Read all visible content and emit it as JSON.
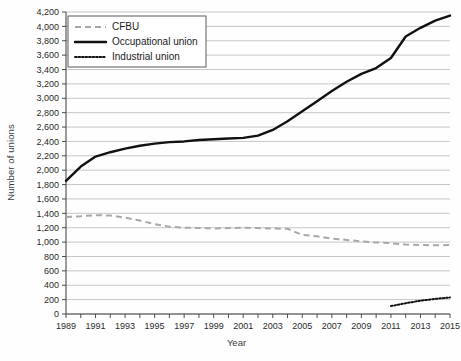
{
  "chart_data": {
    "type": "line",
    "title": "",
    "xlabel": "Year",
    "ylabel": "Number of unions",
    "xlim": [
      1989,
      2015
    ],
    "ylim": [
      0,
      4200
    ],
    "ytick_step": 200,
    "xtick_step": 1,
    "xtick_label_step": 2,
    "grid": true,
    "legend_position": "top-left",
    "x": [
      1989,
      1990,
      1991,
      1992,
      1993,
      1994,
      1995,
      1996,
      1997,
      1998,
      1999,
      2000,
      2001,
      2002,
      2003,
      2004,
      2005,
      2006,
      2007,
      2008,
      2009,
      2010,
      2011,
      2012,
      2013,
      2014,
      2015
    ],
    "xtick_labels": [
      "1989",
      "1991",
      "1993",
      "1995",
      "1997",
      "1999",
      "2001",
      "2003",
      "2005",
      "2007",
      "2009",
      "2011",
      "2013",
      "2015"
    ],
    "ytick_labels": [
      "0",
      "200",
      "400",
      "600",
      "800",
      "1,000",
      "1,200",
      "1,400",
      "1,600",
      "1,800",
      "2,000",
      "2,200",
      "2,400",
      "2,600",
      "2,800",
      "3,000",
      "3,200",
      "3,400",
      "3,600",
      "3,800",
      "4,000",
      "4,200"
    ],
    "series": [
      {
        "name": "CFBU",
        "style": "dashed",
        "color": "#a8a8a8",
        "values": [
          1350,
          1360,
          1375,
          1370,
          1340,
          1300,
          1250,
          1215,
          1200,
          1195,
          1190,
          1195,
          1200,
          1195,
          1190,
          1185,
          1100,
          1080,
          1050,
          1030,
          1010,
          995,
          985,
          965,
          960,
          955,
          960
        ]
      },
      {
        "name": "Occupational union",
        "style": "solid",
        "color": "#111111",
        "values": [
          1850,
          2050,
          2190,
          2250,
          2300,
          2340,
          2370,
          2390,
          2400,
          2420,
          2430,
          2440,
          2450,
          2480,
          2560,
          2680,
          2820,
          2960,
          3100,
          3230,
          3340,
          3420,
          3560,
          3860,
          3980,
          4080,
          4150
        ]
      },
      {
        "name": "Industrial union",
        "style": "dotted",
        "color": "#111111",
        "values": [
          null,
          null,
          null,
          null,
          null,
          null,
          null,
          null,
          null,
          null,
          null,
          null,
          null,
          null,
          null,
          null,
          null,
          null,
          null,
          null,
          null,
          null,
          110,
          150,
          185,
          210,
          230
        ]
      }
    ]
  },
  "legend": {
    "items": [
      {
        "label": "CFBU"
      },
      {
        "label": "Occupational union"
      },
      {
        "label": "Industrial union"
      }
    ]
  }
}
